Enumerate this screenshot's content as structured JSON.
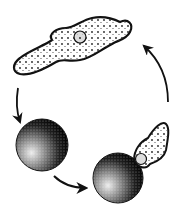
{
  "diagram": {
    "kind": "amoeba-life-cycle",
    "stages": [
      {
        "name": "active-amoeba",
        "label": ""
      },
      {
        "name": "cyst",
        "label": ""
      },
      {
        "name": "excysting-amoeba",
        "label": ""
      }
    ],
    "arrows": [
      {
        "from": "active-amoeba",
        "to": "cyst"
      },
      {
        "from": "cyst",
        "to": "excysting-amoeba"
      },
      {
        "from": "excysting-amoeba",
        "to": "active-amoeba"
      }
    ],
    "colors": {
      "ink": "#111111",
      "background": "#ffffff"
    }
  }
}
